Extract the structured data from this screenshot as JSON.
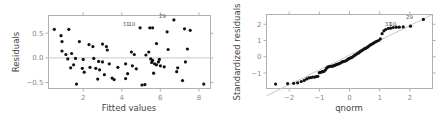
{
  "chart_data": [
    {
      "type": "scatter",
      "title": "",
      "xlabel": "Fitted values",
      "ylabel": "Residuals",
      "xlim": [
        0.2,
        8.6
      ],
      "ylim": [
        -0.62,
        0.86
      ],
      "xticks": [
        2,
        4,
        6,
        8
      ],
      "yticks": [
        -0.5,
        0.0,
        0.5
      ],
      "ytick_labels": [
        "-0.5",
        "0.0",
        "0.5"
      ],
      "grid": false,
      "reference_line": {
        "type": "horizontal",
        "y": 0.0
      },
      "annotations": [
        {
          "label": "31",
          "x": 4.55,
          "y": 0.62
        },
        {
          "label": "10",
          "x": 4.85,
          "y": 0.62
        },
        {
          "label": "29",
          "x": 6.45,
          "y": 0.78
        }
      ],
      "points": [
        [
          0.5,
          0.58
        ],
        [
          0.85,
          0.45
        ],
        [
          0.9,
          0.33
        ],
        [
          0.9,
          0.14
        ],
        [
          1.1,
          0.07
        ],
        [
          1.2,
          -0.02
        ],
        [
          1.25,
          0.58
        ],
        [
          1.35,
          -0.2
        ],
        [
          1.4,
          0.09
        ],
        [
          1.5,
          -0.14
        ],
        [
          1.6,
          -0.01
        ],
        [
          1.65,
          -0.53
        ],
        [
          1.8,
          0.33
        ],
        [
          1.95,
          -0.21
        ],
        [
          2.0,
          -0.03
        ],
        [
          2.05,
          -0.29
        ],
        [
          2.3,
          0.27
        ],
        [
          2.35,
          -0.19
        ],
        [
          2.5,
          0.23
        ],
        [
          2.55,
          -0.01
        ],
        [
          2.65,
          -0.21
        ],
        [
          2.75,
          -0.43
        ],
        [
          2.8,
          -0.07
        ],
        [
          2.85,
          -0.24
        ],
        [
          3.0,
          -0.08
        ],
        [
          3.0,
          0.28
        ],
        [
          3.1,
          -0.34
        ],
        [
          3.2,
          0.23
        ],
        [
          3.25,
          0.16
        ],
        [
          3.35,
          -0.12
        ],
        [
          3.5,
          -0.41
        ],
        [
          3.6,
          -0.44
        ],
        [
          3.8,
          -0.19
        ],
        [
          4.2,
          -0.42
        ],
        [
          4.2,
          -0.12
        ],
        [
          4.3,
          -0.32
        ],
        [
          4.5,
          0.12
        ],
        [
          4.55,
          -0.16
        ],
        [
          4.65,
          0.07
        ],
        [
          4.75,
          -0.22
        ],
        [
          4.95,
          0.61
        ],
        [
          5.05,
          -0.55
        ],
        [
          5.2,
          -0.54
        ],
        [
          5.25,
          0.06
        ],
        [
          5.4,
          0.12
        ],
        [
          5.45,
          0.61
        ],
        [
          5.5,
          -0.02
        ],
        [
          5.55,
          -0.09
        ],
        [
          5.6,
          0.61
        ],
        [
          5.6,
          -0.05
        ],
        [
          5.65,
          -0.31
        ],
        [
          5.7,
          -0.12
        ],
        [
          5.8,
          0.29
        ],
        [
          5.8,
          -0.14
        ],
        [
          5.9,
          -0.08
        ],
        [
          5.95,
          -0.03
        ],
        [
          6.0,
          -0.16
        ],
        [
          6.2,
          -0.18
        ],
        [
          6.35,
          0.53
        ],
        [
          6.4,
          0.17
        ],
        [
          6.7,
          0.77
        ],
        [
          6.85,
          -0.28
        ],
        [
          6.9,
          -0.2
        ],
        [
          7.15,
          -0.46
        ],
        [
          7.25,
          0.59
        ],
        [
          7.3,
          -0.08
        ],
        [
          7.4,
          0.18
        ],
        [
          7.55,
          0.56
        ],
        [
          8.25,
          -0.53
        ]
      ]
    },
    {
      "type": "scatter",
      "title": "",
      "xlabel": "qnorm",
      "ylabel": "Standardized residuals",
      "xlim": [
        -2.75,
        2.75
      ],
      "ylim": [
        -1.95,
        2.6
      ],
      "xticks": [
        -2,
        -1,
        0,
        1,
        2
      ],
      "yticks": [
        -1,
        0,
        1,
        2
      ],
      "grid": false,
      "reference_line": {
        "type": "qq-line",
        "from": [
          -2.75,
          -2.4
        ],
        "to": [
          2.75,
          2.6
        ]
      },
      "annotations": [
        {
          "label": "31",
          "x": 1.5,
          "y": 1.82
        },
        {
          "label": "10",
          "x": 1.65,
          "y": 1.82
        },
        {
          "label": "29",
          "x": 2.2,
          "y": 2.25
        }
      ],
      "points": [
        [
          -2.45,
          -1.68
        ],
        [
          -2.05,
          -1.65
        ],
        [
          -1.85,
          -1.63
        ],
        [
          -1.72,
          -1.6
        ],
        [
          -1.6,
          -1.52
        ],
        [
          -1.5,
          -1.45
        ],
        [
          -1.42,
          -1.36
        ],
        [
          -1.35,
          -1.3
        ],
        [
          -1.28,
          -1.28
        ],
        [
          -1.22,
          -1.25
        ],
        [
          -1.15,
          -1.25
        ],
        [
          -1.1,
          -1.22
        ],
        [
          -1.05,
          -1.2
        ],
        [
          -1.0,
          -0.98
        ],
        [
          -0.94,
          -0.95
        ],
        [
          -0.9,
          -0.92
        ],
        [
          -0.85,
          -0.9
        ],
        [
          -0.8,
          -0.82
        ],
        [
          -0.76,
          -0.7
        ],
        [
          -0.71,
          -0.62
        ],
        [
          -0.67,
          -0.6
        ],
        [
          -0.62,
          -0.6
        ],
        [
          -0.58,
          -0.58
        ],
        [
          -0.54,
          -0.56
        ],
        [
          -0.5,
          -0.54
        ],
        [
          -0.46,
          -0.5
        ],
        [
          -0.42,
          -0.47
        ],
        [
          -0.38,
          -0.45
        ],
        [
          -0.34,
          -0.42
        ],
        [
          -0.3,
          -0.38
        ],
        [
          -0.26,
          -0.33
        ],
        [
          -0.22,
          -0.3
        ],
        [
          -0.18,
          -0.28
        ],
        [
          -0.14,
          -0.26
        ],
        [
          -0.1,
          -0.22
        ],
        [
          -0.06,
          -0.16
        ],
        [
          -0.02,
          -0.12
        ],
        [
          0.02,
          -0.08
        ],
        [
          0.06,
          -0.05
        ],
        [
          0.1,
          -0.02
        ],
        [
          0.14,
          0.04
        ],
        [
          0.18,
          0.1
        ],
        [
          0.22,
          0.14
        ],
        [
          0.26,
          0.2
        ],
        [
          0.3,
          0.24
        ],
        [
          0.34,
          0.3
        ],
        [
          0.38,
          0.35
        ],
        [
          0.42,
          0.4
        ],
        [
          0.46,
          0.45
        ],
        [
          0.5,
          0.5
        ],
        [
          0.54,
          0.52
        ],
        [
          0.58,
          0.58
        ],
        [
          0.62,
          0.62
        ],
        [
          0.67,
          0.7
        ],
        [
          0.71,
          0.75
        ],
        [
          0.76,
          0.8
        ],
        [
          0.8,
          0.85
        ],
        [
          0.85,
          0.9
        ],
        [
          0.9,
          0.95
        ],
        [
          0.96,
          1.0
        ],
        [
          1.02,
          1.1
        ],
        [
          1.08,
          1.42
        ],
        [
          1.14,
          1.6
        ],
        [
          1.2,
          1.68
        ],
        [
          1.28,
          1.74
        ],
        [
          1.36,
          1.76
        ],
        [
          1.45,
          1.8
        ],
        [
          1.55,
          1.82
        ],
        [
          1.65,
          1.82
        ],
        [
          1.78,
          1.84
        ],
        [
          2.02,
          1.88
        ],
        [
          2.45,
          2.3
        ]
      ]
    }
  ]
}
